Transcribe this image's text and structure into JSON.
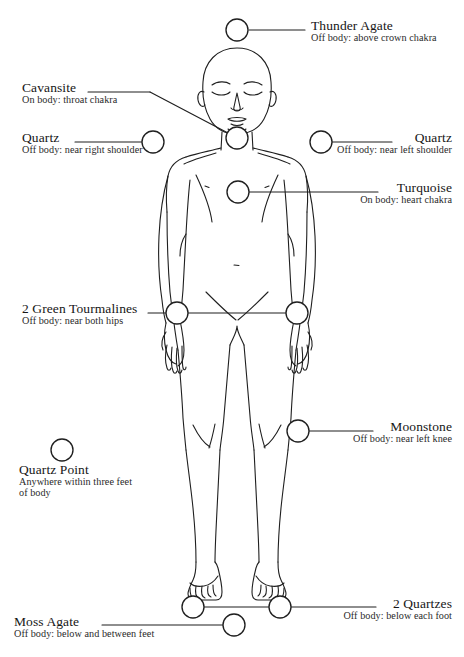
{
  "diagram": {
    "kind": "crystal-body-layout-diagram",
    "stroke_color": "#1f1f1f",
    "marker_fill": "#ffffff",
    "background_color": "#ffffff",
    "canvas": {
      "width": 464,
      "height": 657
    }
  },
  "markers": [
    {
      "id": "thunder-agate",
      "title": "Thunder Agate",
      "sub": "Off body: above crown chakra",
      "cx": 237,
      "cy": 30,
      "r": 11
    },
    {
      "id": "cavansite",
      "title": "Cavansite",
      "sub": "On body: throat chakra",
      "cx": 237,
      "cy": 138,
      "r": 11
    },
    {
      "id": "quartz-right-shoulder",
      "title": "Quartz",
      "sub": "Off body: near right shoulder",
      "cx": 153,
      "cy": 142,
      "r": 11
    },
    {
      "id": "quartz-left-shoulder",
      "title": "Quartz",
      "sub": "Off body: near left shoulder",
      "cx": 321,
      "cy": 142,
      "r": 11
    },
    {
      "id": "turquoise",
      "title": "Turquoise",
      "sub": "On body: heart chakra",
      "cx": 238,
      "cy": 192,
      "r": 11
    },
    {
      "id": "green-tourmalines",
      "title": "2 Green Tourmalines",
      "sub": "Off body: near both hips",
      "cx": 177,
      "cy": 313,
      "cx2": 297,
      "r": 11
    },
    {
      "id": "moonstone",
      "title": "Moonstone",
      "sub": "Off body: near left knee",
      "cx": 298,
      "cy": 431,
      "r": 11
    },
    {
      "id": "quartz-point",
      "title": "Quartz Point",
      "sub": "Anywhere within three feet of body",
      "cx": 62,
      "cy": 450,
      "r": 11
    },
    {
      "id": "two-quartzes",
      "title": "2 Quartzes",
      "sub": "Off body: below each foot",
      "cx": 193,
      "cy": 607,
      "cx2": 280,
      "r": 11
    },
    {
      "id": "moss-agate",
      "title": "Moss Agate",
      "sub": "Off body: below and between feet",
      "cx": 234,
      "cy": 625,
      "r": 11
    }
  ],
  "labels": {
    "thunder_agate": {
      "title": "Thunder Agate",
      "sub": "Off body: above crown chakra"
    },
    "cavansite": {
      "title": "Cavansite",
      "sub": "On body: throat chakra"
    },
    "quartz_right": {
      "title": "Quartz",
      "sub": "Off body: near right shoulder"
    },
    "quartz_left": {
      "title": "Quartz",
      "sub": "Off body: near left shoulder"
    },
    "turquoise": {
      "title": "Turquoise",
      "sub": "On body: heart chakra"
    },
    "green_tourmalines": {
      "title": "2 Green Tourmalines",
      "sub": "Off body: near both hips"
    },
    "moonstone": {
      "title": "Moonstone",
      "sub": "Off body: near left knee"
    },
    "quartz_point": {
      "title": "Quartz Point",
      "sub": "Anywhere within three feet of body"
    },
    "two_quartzes": {
      "title": "2 Quartzes",
      "sub": "Off body: below each foot"
    },
    "moss_agate": {
      "title": "Moss Agate",
      "sub": "Off body: below and between feet"
    }
  }
}
